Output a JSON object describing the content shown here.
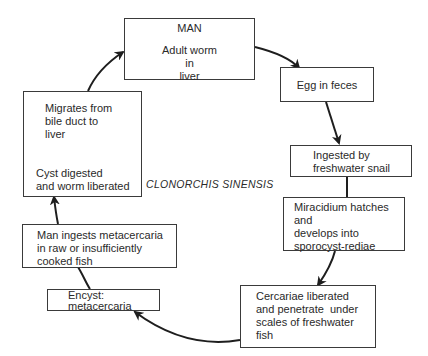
{
  "diagram": {
    "title": "CLONORCHIS SINENSIS",
    "type": "life-cycle",
    "stages": [
      {
        "id": "man",
        "heading": "MAN",
        "lines": [
          "Adult worm",
          "in",
          "liver"
        ]
      },
      {
        "id": "egg",
        "lines": [
          "Egg in feces"
        ]
      },
      {
        "id": "ingested",
        "lines": [
          "Ingested by",
          "freshwater snail"
        ]
      },
      {
        "id": "miracidium",
        "lines": [
          "Miracidium hatches",
          "and",
          "develops into",
          "sporocyst-rediae"
        ]
      },
      {
        "id": "cercariae",
        "lines": [
          "Cercariae liberated",
          "and penetrate  under",
          "scales of freshwater",
          "fish"
        ]
      },
      {
        "id": "encyst",
        "lines": [
          "Encyst:",
          "metacercaria"
        ]
      },
      {
        "id": "man-ingests",
        "lines": [
          "Man ingests metacercaria",
          "in raw or insufficiently",
          "cooked fish"
        ]
      },
      {
        "id": "migrates",
        "top_lines": [
          "Migrates from",
          "bile duct to",
          "liver"
        ],
        "bottom_lines": [
          "Cyst digested",
          "and worm liberated"
        ]
      }
    ],
    "edges": [
      {
        "from": "man",
        "to": "egg"
      },
      {
        "from": "egg",
        "to": "ingested"
      },
      {
        "from": "ingested",
        "to": "miracidium"
      },
      {
        "from": "miracidium",
        "to": "cercariae"
      },
      {
        "from": "cercariae",
        "to": "encyst"
      },
      {
        "from": "encyst",
        "to": "man-ingests"
      },
      {
        "from": "man-ingests",
        "to": "migrates"
      },
      {
        "from": "migrates.cyst",
        "to": "migrates.top",
        "style": "dashed"
      },
      {
        "from": "migrates",
        "to": "man"
      }
    ]
  }
}
